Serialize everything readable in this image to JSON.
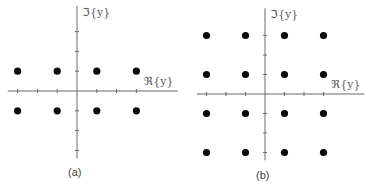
{
  "panels": [
    {
      "id": "a",
      "caption": "(a)",
      "x_axis_label": "ℜ{y}",
      "y_axis_label": "ℑ{y}",
      "origin": [
        77,
        91
      ],
      "unit": 19.8,
      "x_axis_range": [
        -3.5,
        5.1
      ],
      "y_axis_range": [
        -3.4,
        4.3
      ],
      "x_ticks": [
        -3,
        -2,
        -1,
        1,
        2,
        3
      ],
      "y_ticks": [
        -3,
        -2,
        -1,
        1,
        2,
        3
      ],
      "points": [
        [
          -3,
          1
        ],
        [
          -1,
          1
        ],
        [
          1,
          1
        ],
        [
          3,
          1
        ],
        [
          -3,
          -1
        ],
        [
          -1,
          -1
        ],
        [
          1,
          -1
        ],
        [
          3,
          -1
        ]
      ]
    },
    {
      "id": "b",
      "caption": "(b)",
      "x_axis_label": "ℜ{y}",
      "y_axis_label": "ℑ{y}",
      "origin": [
        265,
        94
      ],
      "unit": 19.5,
      "x_axis_range": [
        -3.5,
        5.1
      ],
      "y_axis_range": [
        -3.4,
        4.4
      ],
      "x_ticks": [
        -3,
        -2,
        -1,
        1,
        2,
        3
      ],
      "y_ticks": [
        -3,
        -2,
        -1,
        1,
        2,
        3
      ],
      "points": [
        [
          -3,
          3
        ],
        [
          -1,
          3
        ],
        [
          1,
          3
        ],
        [
          3,
          3
        ],
        [
          -3,
          1
        ],
        [
          -1,
          1
        ],
        [
          1,
          1
        ],
        [
          3,
          1
        ],
        [
          -3,
          -1
        ],
        [
          -1,
          -1
        ],
        [
          1,
          -1
        ],
        [
          3,
          -1
        ],
        [
          -3,
          -3
        ],
        [
          -1,
          -3
        ],
        [
          1,
          -3
        ],
        [
          3,
          -3
        ]
      ]
    }
  ],
  "colors": {
    "axis": "#6a6a6a",
    "point": "#0a0a0a",
    "background": "#ffffff"
  }
}
